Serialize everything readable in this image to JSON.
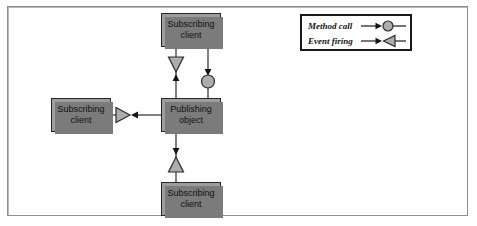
{
  "figure": {
    "type": "diagram",
    "background_color": "#fefefe",
    "frame_color": "#8d8d8d",
    "node_fill_color": "#9d9d9d",
    "node_border_color": "#272727",
    "connector_color": "#1a1a1a"
  },
  "nodes": [
    {
      "id": "node-top",
      "name": "subscribing-client-top",
      "line1": "Subscribing",
      "line2": "client"
    },
    {
      "id": "node-left",
      "name": "subscribing-client-left",
      "line1": "Subscribing",
      "line2": "client"
    },
    {
      "id": "node-center",
      "name": "publishing-object",
      "line1": "Publishing",
      "line2": "object"
    },
    {
      "id": "node-bottom",
      "name": "subscribing-client-bottom",
      "line1": "Subscribing",
      "line2": "client"
    }
  ],
  "connectors": [
    {
      "name": "event-firing-to-top-client",
      "from": "node-center",
      "to": "node-top",
      "kind": "event firing",
      "marker": "triangle"
    },
    {
      "name": "method-call-from-top-client",
      "from": "node-top",
      "to": "node-center",
      "kind": "method call",
      "marker": "circle"
    },
    {
      "name": "event-firing-to-left-client",
      "from": "node-center",
      "to": "node-left",
      "kind": "event firing",
      "marker": "triangle"
    },
    {
      "name": "event-firing-to-bottom-client",
      "from": "node-center",
      "to": "node-bottom",
      "kind": "event firing",
      "marker": "triangle"
    }
  ],
  "legend": {
    "rows": [
      {
        "label": "Method call",
        "marker": "circle"
      },
      {
        "label": "Event firing",
        "marker": "triangle"
      }
    ]
  }
}
